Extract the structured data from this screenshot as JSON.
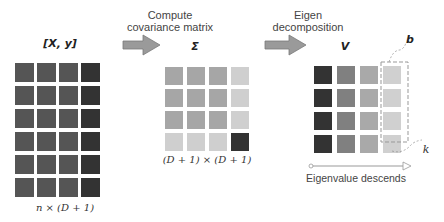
{
  "labels": {
    "xy_matrix_title": "[X, y]",
    "sigma_title": "Σ",
    "v_title": "V",
    "step1": [
      "Compute",
      "covariance matrix"
    ],
    "step2": [
      "Eigen",
      "decomposition"
    ],
    "xy_dims": "n × (D + 1)",
    "sigma_dims": "(D + 1) × (D + 1)",
    "b_label": "b",
    "k_label": "k",
    "eigen_axis": "Eigenvalue descends"
  },
  "matrices": {
    "xy": {
      "rows": 6,
      "cols": 4,
      "colors": [
        [
          "#555555",
          "#555555",
          "#555555",
          "#333333"
        ],
        [
          "#555555",
          "#555555",
          "#555555",
          "#333333"
        ],
        [
          "#555555",
          "#555555",
          "#555555",
          "#333333"
        ],
        [
          "#555555",
          "#555555",
          "#555555",
          "#333333"
        ],
        [
          "#555555",
          "#555555",
          "#555555",
          "#333333"
        ],
        [
          "#555555",
          "#555555",
          "#555555",
          "#333333"
        ]
      ]
    },
    "sigma": {
      "rows": 4,
      "cols": 4,
      "colors": [
        [
          "#a6a6a6",
          "#a6a6a6",
          "#a6a6a6",
          "#cfcfcf"
        ],
        [
          "#a6a6a6",
          "#a6a6a6",
          "#a6a6a6",
          "#cfcfcf"
        ],
        [
          "#a6a6a6",
          "#a6a6a6",
          "#a6a6a6",
          "#cfcfcf"
        ],
        [
          "#cfcfcf",
          "#cfcfcf",
          "#cfcfcf",
          "#333333"
        ]
      ]
    },
    "v": {
      "rows": 4,
      "cols": 4,
      "colors": [
        [
          "#333333",
          "#808080",
          "#a9a9a9",
          "#d0d0d0"
        ],
        [
          "#333333",
          "#808080",
          "#a9a9a9",
          "#d0d0d0"
        ],
        [
          "#333333",
          "#808080",
          "#a9a9a9",
          "#d0d0d0"
        ],
        [
          "#333333",
          "#808080",
          "#a9a9a9",
          "#d0d0d0"
        ]
      ]
    }
  },
  "colors": {
    "arrow_fill": "#9a9a9a",
    "arrow_stroke": "#7a7a7a",
    "dash": "#999999"
  }
}
